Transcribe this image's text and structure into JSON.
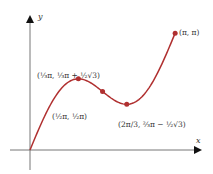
{
  "chart_data": {
    "type": "line",
    "title": "",
    "function": "y = x + sin(2x)",
    "xlabel": "x",
    "ylabel": "y",
    "xlim": [
      0,
      3.14159
    ],
    "ylim": [
      0,
      3.14159
    ],
    "grid": false,
    "series": [
      {
        "name": "curve",
        "color": "#b03030",
        "x": [
          0,
          0.2618,
          0.5236,
          0.7854,
          1.0472,
          1.309,
          1.5708,
          1.8326,
          2.0944,
          2.3562,
          2.618,
          2.8798,
          3.1416
        ],
        "values": [
          0,
          0.7618,
          1.3896,
          1.7854,
          1.9132,
          1.809,
          1.5708,
          1.3326,
          1.2284,
          1.3562,
          1.752,
          2.3798,
          3.1416
        ]
      }
    ],
    "points": [
      {
        "x": 1.0472,
        "y": 1.9132,
        "label": "(⅓π, ⅓π + ½√3)"
      },
      {
        "x": 1.5708,
        "y": 1.5708,
        "label": "(½π, ½π)"
      },
      {
        "x": 2.0944,
        "y": 1.2284,
        "label": "(2π/3, ⅔π − ½√3)"
      },
      {
        "x": 3.1416,
        "y": 3.1416,
        "label": "(π, π)"
      }
    ]
  },
  "labels": {
    "x_axis": "x",
    "y_axis": "y",
    "max_point": "(⅓π, ⅓π + ½√3)",
    "inflection_point": "(½π, ½π)",
    "min_point": "(2π/3, ⅔π − ½√3)",
    "end_point": "(π, π)"
  }
}
